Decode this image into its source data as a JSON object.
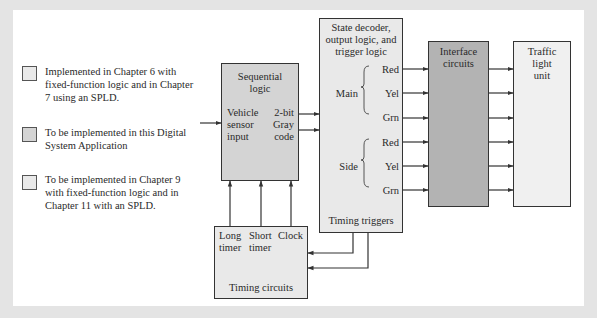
{
  "legend": {
    "items": [
      {
        "text": "Implemented in Chapter 6 with fixed-function logic and in Chapter 7 using an SPLD.",
        "swatch_color": "#e9e9e9"
      },
      {
        "text": "To be implemented in this Digital System Application",
        "swatch_color": "#d4d4d4"
      },
      {
        "text": "To be implemented in Chapter 9 with fixed-function logic and in Chapter 11 with an SPLD.",
        "swatch_color": "#e9e9e9"
      }
    ]
  },
  "blocks": {
    "sequential": {
      "title_line1": "Sequential",
      "title_line2": "logic",
      "input_line1": "Vehicle",
      "input_line2": "sensor",
      "input_line3": "input",
      "output_line1": "2-bit",
      "output_line2": "Gray",
      "output_line3": "code"
    },
    "decoder": {
      "title_line1": "State decoder,",
      "title_line2": "output logic, and",
      "title_line3": "trigger logic",
      "main_label": "Main",
      "side_label": "Side",
      "main_outputs": [
        "Red",
        "Yel",
        "Grn"
      ],
      "side_outputs": [
        "Red",
        "Yel",
        "Grn"
      ],
      "footer": "Timing triggers"
    },
    "interface": {
      "title_line1": "Interface",
      "title_line2": "circuits"
    },
    "traffic": {
      "title_line1": "Traffic",
      "title_line2": "light",
      "title_line3": "unit"
    },
    "timing": {
      "col1_line1": "Long",
      "col1_line2": "timer",
      "col2_line1": "Short",
      "col2_line2": "timer",
      "col3_line1": "Clock",
      "footer": "Timing circuits"
    }
  },
  "colors": {
    "background": "#e4e4e4",
    "panel": "#ffffff",
    "light_block": "#e9e9e9",
    "mid_block": "#d4d4d4",
    "dark_block": "#b3b3b3",
    "line": "#333333"
  }
}
